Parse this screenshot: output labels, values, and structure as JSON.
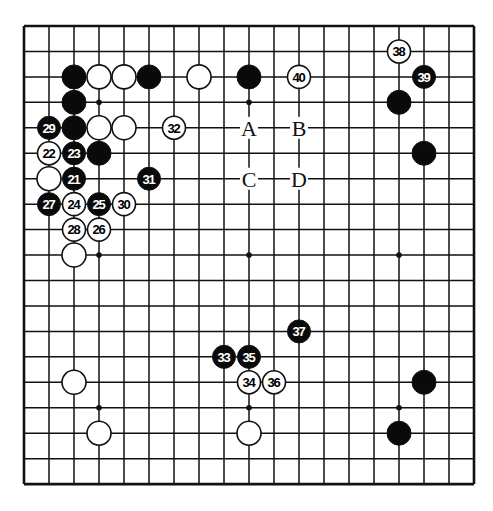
{
  "board": {
    "size": 19,
    "origin_x": 24,
    "origin_y": 26,
    "spacing_x": 25,
    "spacing_y": 25.45,
    "stone_radius": 12,
    "line_color": "#111111",
    "black_color": "#0a0a0a",
    "white_color": "#ffffff",
    "star_points": [
      [
        3,
        3
      ],
      [
        9,
        3
      ],
      [
        15,
        3
      ],
      [
        3,
        9
      ],
      [
        9,
        9
      ],
      [
        15,
        9
      ],
      [
        3,
        15
      ],
      [
        9,
        15
      ],
      [
        15,
        15
      ]
    ]
  },
  "stones": [
    {
      "color": "black",
      "col": 2,
      "row": 2,
      "label": ""
    },
    {
      "color": "white",
      "col": 3,
      "row": 2,
      "label": ""
    },
    {
      "color": "white",
      "col": 4,
      "row": 2,
      "label": ""
    },
    {
      "color": "black",
      "col": 5,
      "row": 2,
      "label": ""
    },
    {
      "color": "white",
      "col": 7,
      "row": 2,
      "label": ""
    },
    {
      "color": "black",
      "col": 9,
      "row": 2,
      "label": ""
    },
    {
      "color": "black",
      "col": 2,
      "row": 3,
      "label": ""
    },
    {
      "color": "black",
      "col": 2,
      "row": 4,
      "label": ""
    },
    {
      "color": "white",
      "col": 3,
      "row": 4,
      "label": ""
    },
    {
      "color": "white",
      "col": 4,
      "row": 4,
      "label": ""
    },
    {
      "color": "black",
      "col": 3,
      "row": 5,
      "label": ""
    },
    {
      "color": "white",
      "col": 1,
      "row": 6,
      "label": ""
    },
    {
      "color": "white",
      "col": 2,
      "row": 9,
      "label": ""
    },
    {
      "color": "white",
      "col": 2,
      "row": 14,
      "label": ""
    },
    {
      "color": "white",
      "col": 3,
      "row": 16,
      "label": ""
    },
    {
      "color": "white",
      "col": 9,
      "row": 16,
      "label": ""
    },
    {
      "color": "black",
      "col": 15,
      "row": 3,
      "label": ""
    },
    {
      "color": "black",
      "col": 16,
      "row": 5,
      "label": ""
    },
    {
      "color": "black",
      "col": 16,
      "row": 14,
      "label": ""
    },
    {
      "color": "black",
      "col": 15,
      "row": 16,
      "label": ""
    },
    {
      "color": "black",
      "col": 2,
      "row": 6,
      "label": "21"
    },
    {
      "color": "white",
      "col": 1,
      "row": 5,
      "label": "22"
    },
    {
      "color": "black",
      "col": 2,
      "row": 5,
      "label": "23"
    },
    {
      "color": "white",
      "col": 2,
      "row": 7,
      "label": "24"
    },
    {
      "color": "black",
      "col": 3,
      "row": 7,
      "label": "25"
    },
    {
      "color": "white",
      "col": 3,
      "row": 8,
      "label": "26"
    },
    {
      "color": "black",
      "col": 1,
      "row": 7,
      "label": "27"
    },
    {
      "color": "white",
      "col": 2,
      "row": 8,
      "label": "28"
    },
    {
      "color": "black",
      "col": 1,
      "row": 4,
      "label": "29"
    },
    {
      "color": "white",
      "col": 4,
      "row": 7,
      "label": "30"
    },
    {
      "color": "black",
      "col": 5,
      "row": 6,
      "label": "31"
    },
    {
      "color": "white",
      "col": 6,
      "row": 4,
      "label": "32"
    },
    {
      "color": "black",
      "col": 8,
      "row": 13,
      "label": "33"
    },
    {
      "color": "white",
      "col": 9,
      "row": 14,
      "label": "34"
    },
    {
      "color": "black",
      "col": 9,
      "row": 13,
      "label": "35"
    },
    {
      "color": "white",
      "col": 10,
      "row": 14,
      "label": "36"
    },
    {
      "color": "black",
      "col": 11,
      "row": 12,
      "label": "37"
    },
    {
      "color": "white",
      "col": 15,
      "row": 1,
      "label": "38"
    },
    {
      "color": "black",
      "col": 16,
      "row": 2,
      "label": "39"
    },
    {
      "color": "white",
      "col": 11,
      "row": 2,
      "label": "40"
    }
  ],
  "markers": [
    {
      "label": "A",
      "col": 9,
      "row": 4
    },
    {
      "label": "B",
      "col": 11,
      "row": 4
    },
    {
      "label": "C",
      "col": 9,
      "row": 6
    },
    {
      "label": "D",
      "col": 11,
      "row": 6
    }
  ]
}
